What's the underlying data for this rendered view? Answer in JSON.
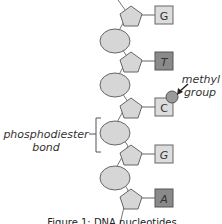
{
  "diagram": {
    "type": "dna-strand",
    "colors": {
      "sugar": "#d6d6d6",
      "phosphate": "#d6d6d6",
      "stroke": "#666666",
      "base_light": "#dcdcdc",
      "base_dark": "#8a8a8a",
      "methyl": "#9a9a9a"
    },
    "bases": [
      {
        "letter": "G",
        "shade": "light"
      },
      {
        "letter": "T",
        "shade": "dark"
      },
      {
        "letter": "C",
        "shade": "light",
        "methylated": true
      },
      {
        "letter": "G",
        "shade": "light"
      },
      {
        "letter": "A",
        "shade": "dark"
      }
    ],
    "labels": {
      "methyl_line1": "methyl",
      "methyl_line2": "group",
      "bond_line1": "phosphodiester",
      "bond_line2": "bond"
    },
    "caption": "Figure 1: DNA nucleotides"
  }
}
